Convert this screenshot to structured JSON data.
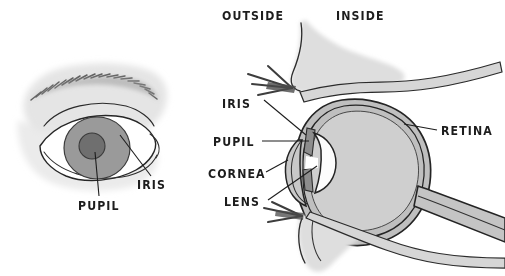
{
  "figure": {
    "background_color": "#ffffff",
    "ink_color": "#1d1d1d",
    "width": 505,
    "height": 276
  },
  "orientation_labels": {
    "outside": "OUTSIDE",
    "inside": "INSIDE"
  },
  "external_eye": {
    "labels": {
      "pupil": "PUPIL",
      "iris": "IRIS"
    },
    "colors": {
      "iris_fill": "#9a9a9a",
      "pupil_fill": "#6f6f6f",
      "sclera_fill": "#ffffff",
      "skin_wash": "#e2e2e2",
      "brow_hair": "#5a5a5a"
    }
  },
  "cross_section": {
    "labels": {
      "iris": "IRIS",
      "pupil": "PUPIL",
      "cornea": "CORNEA",
      "lens": "LENS",
      "retina": "RETINA"
    },
    "colors": {
      "vitreous_fill": "#cfcfcf",
      "coat_fill": "#bdbdbd",
      "lens_fill": "#fcfcfc",
      "iris_flap": "#8d8d8d",
      "eyelid_wash": "#dcdcdc",
      "lash_ink": "#4a4a4a",
      "optic_nerve_fill": "#c4c4c4"
    }
  }
}
